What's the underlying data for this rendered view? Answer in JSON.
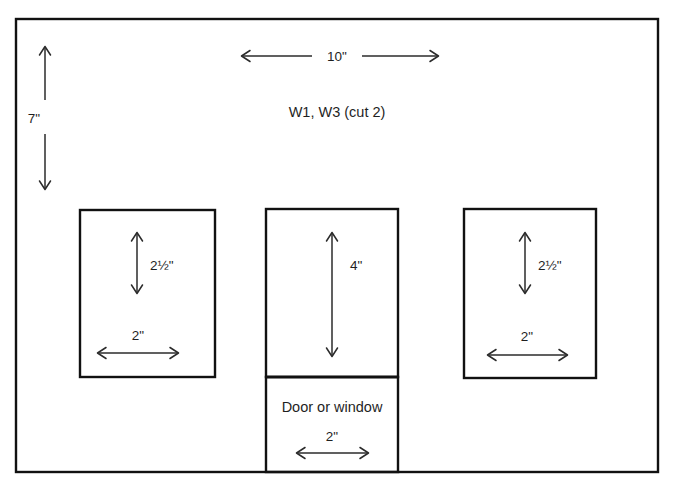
{
  "diagram": {
    "title": "W1, W3 (cut 2)",
    "panel_label": "W1, W3 (cut 2)",
    "overall": {
      "width_label": "10\"",
      "height_label": "7\""
    },
    "openings": [
      {
        "name": "left-window",
        "height_label": "2½\"",
        "width_label": "2\""
      },
      {
        "name": "center-window",
        "height_label": "4\"",
        "width_label": ""
      },
      {
        "name": "right-window",
        "height_label": "2½\"",
        "width_label": "2\""
      }
    ],
    "door_section": {
      "label": "Door or window",
      "width_label": "2\""
    },
    "colors": {
      "stroke": "#111111",
      "dimension": "#2b2b2b",
      "background": "#ffffff",
      "text": "#1f1f1f"
    }
  }
}
